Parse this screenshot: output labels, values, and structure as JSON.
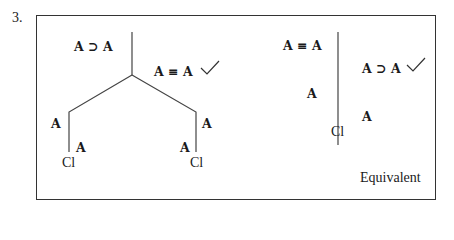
{
  "problem_number": "3.",
  "left_tree": {
    "root_left_formula": "A ⊃ A",
    "root_right_formula": "A ≡ A",
    "root_right_checked": true,
    "left_branch": {
      "outer_label": "A",
      "inner_label": "A",
      "closure": "Cl"
    },
    "right_branch": {
      "outer_label": "A",
      "inner_label": "A",
      "closure": "Cl"
    }
  },
  "right_tree": {
    "left_top_formula": "A ≡ A",
    "left_lower_formula": "A",
    "right_top_formula": "A ⊃ A",
    "right_top_checked": true,
    "right_lower_formula": "A",
    "closure": "Cl"
  },
  "verdict": "Equivalent",
  "colors": {
    "ink": "#1a1a1a",
    "line": "#444444",
    "border": "#333333"
  }
}
